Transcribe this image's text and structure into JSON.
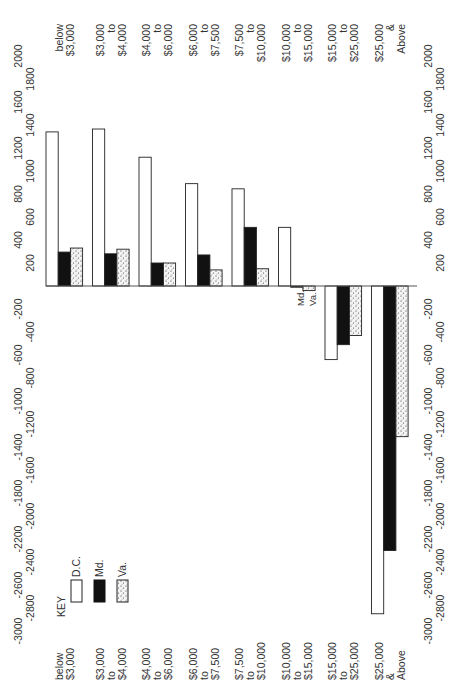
{
  "chart_data": {
    "type": "bar",
    "orientation": "rotated-90-ccw (values run vertically: positive up, negative down)",
    "title": "",
    "xlabel": "",
    "ylabel": "",
    "categories": [
      "below $3,000",
      "$3,000 to $4,000",
      "$4,000 to $6,000",
      "$6,000 to $7,500",
      "$7,500 to $10,000",
      "$10,000 to $15,000",
      "$15,000 to $25,000",
      "$25,000 & Above"
    ],
    "category_label_lines": [
      [
        "below",
        "$3,000"
      ],
      [
        "$3,000",
        "to",
        "$4,000"
      ],
      [
        "$4,000",
        "to",
        "$6,000"
      ],
      [
        "$6,000",
        "to",
        "$7,500"
      ],
      [
        "$7,500",
        "to",
        "$10,000"
      ],
      [
        "$10,000",
        "to",
        "$15,000"
      ],
      [
        "$15,000",
        "to",
        "$25,000"
      ],
      [
        "$25,000",
        "&",
        "Above"
      ]
    ],
    "series": [
      {
        "name": "D.C.",
        "style": "white",
        "values": [
          1340,
          1365,
          1120,
          890,
          845,
          510,
          -640,
          -2850
        ]
      },
      {
        "name": "Md.",
        "style": "black",
        "values": [
          295,
          280,
          200,
          270,
          510,
          -10,
          -510,
          -2300
        ]
      },
      {
        "name": "Va.",
        "style": "stippled",
        "values": [
          330,
          320,
          200,
          140,
          150,
          -40,
          -430,
          -1310
        ]
      }
    ],
    "ylim": [
      -3000,
      2000
    ],
    "yticks": [
      2000,
      1800,
      1600,
      1400,
      1200,
      1000,
      800,
      600,
      400,
      200,
      -200,
      -400,
      -600,
      -800,
      -1000,
      -1200,
      -1400,
      -1600,
      -1800,
      -2000,
      -2200,
      -2400,
      -2600,
      -2800,
      -3000
    ],
    "grid": false,
    "legend": {
      "title": "KEY",
      "position": "lower-left",
      "entries": [
        "D.C.",
        "Md.",
        "Va."
      ]
    },
    "annotations": [
      {
        "text": "Md.",
        "near": "$10,000 to $15,000 Md. bar"
      },
      {
        "text": "Va.",
        "near": "$10,000 to $15,000 Va. bar"
      }
    ]
  },
  "legend": {
    "title": "KEY",
    "dc": "D.C.",
    "md": "Md.",
    "va": "Va."
  },
  "annotations": {
    "md": "Md.",
    "va": "Va."
  }
}
